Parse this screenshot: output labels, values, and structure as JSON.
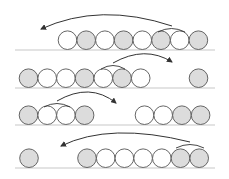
{
  "diagram": {
    "colors": {
      "gray_fill": "#dcdcdc",
      "white_fill": "#ffffff",
      "stroke": "#555555",
      "baseline": "#c8c8c8",
      "arrow": "#333333"
    },
    "radius": 9.3,
    "rows": [
      {
        "baseline_y": 50,
        "baseline_x": [
          15,
          215
        ],
        "circles": [
          {
            "x": 67.5,
            "fill": "white"
          },
          {
            "x": 86.2,
            "fill": "gray"
          },
          {
            "x": 104.9,
            "fill": "white"
          },
          {
            "x": 123.6,
            "fill": "gray"
          },
          {
            "x": 142.3,
            "fill": "white"
          },
          {
            "x": 161.0,
            "fill": "gray"
          },
          {
            "x": 179.7,
            "fill": "white"
          },
          {
            "x": 198.4,
            "fill": "gray"
          }
        ],
        "bracket": {
          "x1": 158,
          "x2": 185,
          "y": 29
        },
        "arrow": {
          "from": [
            172,
            26
          ],
          "ctrl": [
            100,
            2
          ],
          "to": [
            41,
            29
          ],
          "direction": "left"
        }
      },
      {
        "baseline_y": 88,
        "baseline_x": [
          15,
          215
        ],
        "circles": [
          {
            "x": 28.5,
            "fill": "gray"
          },
          {
            "x": 47.2,
            "fill": "white"
          },
          {
            "x": 65.9,
            "fill": "white"
          },
          {
            "x": 84.6,
            "fill": "gray"
          },
          {
            "x": 103.3,
            "fill": "white"
          },
          {
            "x": 122.0,
            "fill": "gray"
          },
          {
            "x": 140.7,
            "fill": "white"
          },
          {
            "x": 198.5,
            "fill": "gray"
          }
        ],
        "bracket": {
          "x1": 101,
          "x2": 125,
          "y": 66
        },
        "arrow": {
          "from": [
            113,
            63
          ],
          "ctrl": [
            145,
            45
          ],
          "to": [
            172,
            62
          ],
          "direction": "right"
        }
      },
      {
        "baseline_y": 125,
        "baseline_x": [
          15,
          215
        ],
        "circles": [
          {
            "x": 28.5,
            "fill": "gray"
          },
          {
            "x": 47.2,
            "fill": "white"
          },
          {
            "x": 65.9,
            "fill": "white"
          },
          {
            "x": 84.6,
            "fill": "gray"
          },
          {
            "x": 144.5,
            "fill": "white"
          },
          {
            "x": 163.2,
            "fill": "white"
          },
          {
            "x": 181.9,
            "fill": "gray"
          },
          {
            "x": 200.6,
            "fill": "gray"
          }
        ],
        "bracket": {
          "x1": 44,
          "x2": 70,
          "y": 104
        },
        "arrow": {
          "from": [
            57,
            101
          ],
          "ctrl": [
            90,
            82
          ],
          "to": [
            116,
            103
          ],
          "direction": "right"
        }
      },
      {
        "baseline_y": 168,
        "baseline_x": [
          15,
          215
        ],
        "circles": [
          {
            "x": 29.0,
            "fill": "gray"
          },
          {
            "x": 87.0,
            "fill": "gray"
          },
          {
            "x": 105.7,
            "fill": "white"
          },
          {
            "x": 124.4,
            "fill": "white"
          },
          {
            "x": 143.1,
            "fill": "white"
          },
          {
            "x": 161.8,
            "fill": "white"
          },
          {
            "x": 180.5,
            "fill": "gray"
          },
          {
            "x": 199.2,
            "fill": "gray"
          }
        ],
        "bracket": {
          "x1": 176,
          "x2": 204,
          "y": 145
        },
        "arrow": {
          "from": [
            190,
            142
          ],
          "ctrl": [
            110,
            122
          ],
          "to": [
            61,
            146
          ],
          "direction": "left"
        }
      }
    ]
  }
}
